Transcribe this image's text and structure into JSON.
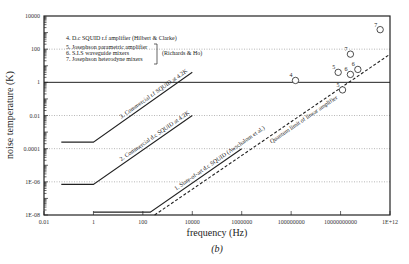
{
  "chart_data": {
    "type": "line",
    "title": "",
    "caption": "(b)",
    "xlabel": "frequency (Hz)",
    "ylabel": "noise temperature (K)",
    "xscale": "log",
    "yscale": "log",
    "xlim": [
      0.01,
      1000000000000.0
    ],
    "ylim": [
      1e-08,
      10000
    ],
    "x_ticks": [
      {
        "value": 0.01,
        "label": "0.01"
      },
      {
        "value": 1,
        "label": "1"
      },
      {
        "value": 100,
        "label": "100"
      },
      {
        "value": 10000,
        "label": "10000"
      },
      {
        "value": 1000000,
        "label": "1000000"
      },
      {
        "value": 100000000,
        "label": "100000000"
      },
      {
        "value": 10000000000,
        "label": "10000000000"
      },
      {
        "value": 1000000000000.0,
        "label": "1E+12"
      }
    ],
    "y_ticks": [
      {
        "value": 10000,
        "label": "10000"
      },
      {
        "value": 100,
        "label": "100"
      },
      {
        "value": 1,
        "label": "1"
      },
      {
        "value": 0.01,
        "label": "0.01"
      },
      {
        "value": 0.0001,
        "label": "0.0001"
      },
      {
        "value": 1e-06,
        "label": "1E-06"
      },
      {
        "value": 1e-08,
        "label": "1E-08"
      }
    ],
    "grid": "dotted horizontal at 100, 0.01, 0.0001, 1E-06; solid line at 1",
    "series": [
      {
        "name": "3. Commercial r.f SQUID at 4.2K",
        "style": "solid",
        "x": [
          0.05,
          1,
          10000
        ],
        "y": [
          0.00025,
          0.00025,
          4
        ]
      },
      {
        "name": "2. Commercial d.c SQUID at 4.2K",
        "style": "solid",
        "x": [
          0.05,
          1,
          10000
        ],
        "y": [
          7e-07,
          7e-07,
          0.01
        ]
      },
      {
        "name": "1. State-of-art d.c SQUID (Awschalom et al.)",
        "style": "solid",
        "x": [
          1,
          200,
          1000000
        ],
        "y": [
          1.5e-08,
          1.5e-08,
          0.0001
        ]
      },
      {
        "name": "Quantum limit of linear amplifier",
        "style": "dashed",
        "x": [
          300,
          1000000000000.0
        ],
        "y": [
          1e-08,
          50
        ]
      }
    ],
    "points": [
      {
        "label": "4",
        "x": 150000000,
        "y": 1.3
      },
      {
        "label": "5",
        "x": 8000000000,
        "y": 4
      },
      {
        "label": "5",
        "x": 12000000000,
        "y": 0.35
      },
      {
        "label": "6",
        "x": 25000000000,
        "y": 3
      },
      {
        "label": "6",
        "x": 50000000000,
        "y": 6
      },
      {
        "label": "7",
        "x": 25000000000,
        "y": 50
      },
      {
        "label": "7",
        "x": 400000000000,
        "y": 1500
      }
    ],
    "annotations": [
      "4. D.c SQUID r.f amplifier (Hilbert & Clarke)",
      "5. Josephson parametric amplifier",
      "6. S.I.S waveguide mixers",
      "7. Josephson heterodyne mixers",
      "(Richards & Ho)"
    ]
  }
}
